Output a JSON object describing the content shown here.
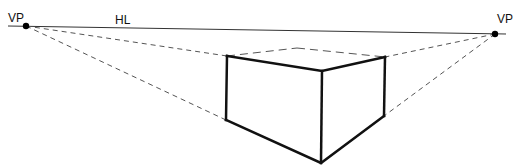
{
  "diagram": {
    "labels": {
      "left_vp": "VP",
      "right_vp": "VP",
      "horizon": "HL"
    },
    "colors": {
      "ink": "#111111",
      "guide": "#555555",
      "horizon": "#333333"
    },
    "points": {
      "left_vp": [
        26,
        26
      ],
      "right_vp": [
        495,
        34
      ],
      "box_top_left": [
        227,
        56
      ],
      "box_top_front": [
        322,
        71
      ],
      "box_top_right": [
        385,
        57
      ],
      "box_top_back": [
        297,
        48
      ],
      "box_bottom_left": [
        226,
        120
      ],
      "box_bottom_front": [
        321,
        163
      ],
      "box_bottom_right": [
        384,
        116
      ]
    }
  }
}
